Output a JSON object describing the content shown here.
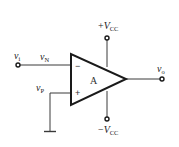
{
  "diagram": {
    "type": "op-amp-circuit",
    "amplifier": {
      "label": "A",
      "inverting_sign": "−",
      "noninverting_sign": "+"
    },
    "labels": {
      "input_terminal": {
        "main": "v",
        "sub": "i"
      },
      "inverting_node": {
        "main": "v",
        "sub": "N"
      },
      "noninverting_node": {
        "main": "v",
        "sub": "P"
      },
      "output_terminal": {
        "main": "v",
        "sub": "o"
      },
      "positive_supply": {
        "prefix": "+",
        "main": "V",
        "sub": "CC"
      },
      "negative_supply": {
        "prefix": "−",
        "main": "V",
        "sub": "CC"
      }
    },
    "colors": {
      "line": "#1a1a1a",
      "background": "#ffffff"
    }
  }
}
